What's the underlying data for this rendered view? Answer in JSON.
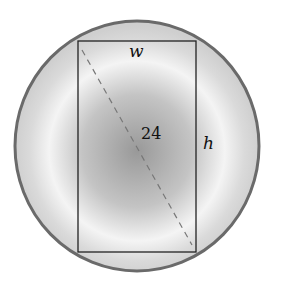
{
  "figure": {
    "type": "rectangle inscribed in circle",
    "labels": {
      "width": "w",
      "height": "h",
      "diagonal": "24"
    },
    "colors": {
      "circle_edge": "#6a6a6a",
      "circle_fill_light": "#f2f2f2",
      "circle_fill_dark": "#9a9a9a",
      "rectangle_stroke": "#222222",
      "diagonal_stroke": "#777777"
    }
  }
}
